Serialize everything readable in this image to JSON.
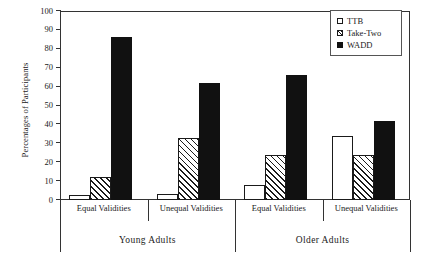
{
  "chart_data": {
    "type": "bar",
    "title": "",
    "xlabel": "",
    "ylabel": "Percentages of Participants",
    "ylim": [
      0,
      100
    ],
    "yticks": [
      0,
      10,
      20,
      30,
      40,
      50,
      60,
      70,
      80,
      90,
      100
    ],
    "grid": false,
    "legend_position": "top-right",
    "categories": [
      "Equal Validities",
      "Unequal Validities",
      "Equal Validities",
      "Unequal Validities"
    ],
    "supergroups": [
      {
        "label": "Young Adults",
        "categories": [
          "Equal Validities",
          "Unequal Validities"
        ]
      },
      {
        "label": "Older Adults",
        "categories": [
          "Equal Validities",
          "Unequal Validities"
        ]
      }
    ],
    "series": [
      {
        "name": "TTB",
        "values": [
          2.5,
          3,
          8,
          34
        ]
      },
      {
        "name": "Take-Two",
        "values": [
          12,
          33,
          24,
          24
        ]
      },
      {
        "name": "WADD",
        "values": [
          86,
          62,
          66,
          42
        ]
      }
    ]
  },
  "axis": {
    "y_title": "Percentages of Participants",
    "y_ticks": [
      "0",
      "10",
      "20",
      "30",
      "40",
      "50",
      "60",
      "70",
      "80",
      "90",
      "100"
    ]
  },
  "legend": {
    "items": [
      {
        "label": "TTB",
        "swatch": "open-square-icon"
      },
      {
        "label": "Take-Two",
        "swatch": "hatched-square-icon"
      },
      {
        "label": "WADD",
        "swatch": "filled-square-icon"
      }
    ]
  },
  "xaxis": {
    "tier1": [
      "Equal Validities",
      "Unequal Validities",
      "Equal Validities",
      "Unequal Validities"
    ],
    "tier2": [
      "Young Adults",
      "Older Adults"
    ]
  }
}
